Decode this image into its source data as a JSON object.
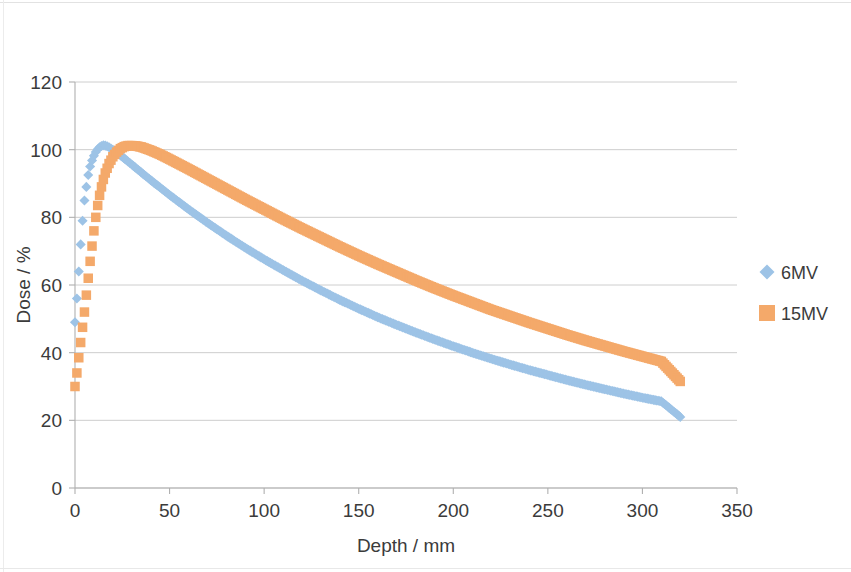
{
  "chart_data": {
    "type": "scatter",
    "title": "",
    "xlabel": "Depth / mm",
    "ylabel": "Dose / %",
    "xlim": [
      0,
      350
    ],
    "ylim": [
      0,
      120
    ],
    "xticks": [
      0,
      50,
      100,
      150,
      200,
      250,
      300,
      350
    ],
    "yticks": [
      0,
      20,
      40,
      60,
      80,
      100,
      120
    ],
    "grid": "horizontal",
    "legend_position": "right",
    "series": [
      {
        "name": "6MV",
        "marker": "diamond",
        "color": "#9DC3E6",
        "x": [
          0,
          1,
          2,
          3,
          4,
          5,
          6,
          7,
          8,
          9,
          10,
          11,
          12,
          13,
          14,
          15,
          16,
          17,
          18,
          20,
          22,
          25,
          28,
          30,
          35,
          40,
          45,
          50,
          60,
          70,
          80,
          90,
          100,
          110,
          120,
          130,
          140,
          150,
          160,
          170,
          180,
          190,
          200,
          210,
          220,
          230,
          240,
          250,
          260,
          270,
          280,
          290,
          300,
          310,
          320
        ],
        "y": [
          49,
          56,
          64,
          72,
          79,
          85,
          89,
          92.5,
          95,
          96.8,
          98.2,
          99.3,
          100.1,
          100.7,
          101.1,
          101.3,
          101.2,
          101.0,
          100.7,
          100.0,
          99.2,
          97.9,
          96.5,
          95.6,
          93.3,
          91.0,
          88.8,
          86.6,
          82.4,
          78.4,
          74.6,
          71.0,
          67.6,
          64.4,
          61.3,
          58.4,
          55.6,
          53.0,
          50.5,
          48.2,
          46.0,
          43.9,
          41.9,
          40.0,
          38.2,
          36.5,
          34.9,
          33.4,
          31.9,
          30.5,
          29.2,
          27.9,
          26.7,
          25.6,
          21.0
        ]
      },
      {
        "name": "15MV",
        "marker": "square",
        "color": "#F4A96A",
        "x": [
          0,
          1,
          2,
          3,
          4,
          5,
          6,
          7,
          8,
          9,
          10,
          11,
          12,
          13,
          14,
          15,
          16,
          18,
          20,
          22,
          24,
          26,
          28,
          30,
          32,
          35,
          40,
          45,
          50,
          60,
          70,
          80,
          90,
          100,
          110,
          120,
          130,
          140,
          150,
          160,
          170,
          180,
          190,
          200,
          210,
          220,
          230,
          240,
          250,
          260,
          270,
          280,
          290,
          300,
          310,
          320
        ],
        "y": [
          30,
          34,
          38.5,
          43,
          47.5,
          52,
          57,
          62,
          67,
          71.5,
          76,
          80,
          83.5,
          86.5,
          89,
          91.2,
          93.1,
          95.9,
          97.9,
          99.3,
          100.3,
          100.9,
          101.2,
          101.2,
          101.1,
          100.8,
          99.8,
          98.6,
          97.2,
          94.3,
          91.3,
          88.3,
          85.3,
          82.4,
          79.5,
          76.7,
          74.0,
          71.3,
          68.7,
          66.2,
          63.8,
          61.4,
          59.1,
          56.9,
          54.8,
          52.7,
          50.8,
          48.9,
          47.1,
          45.3,
          43.6,
          42.0,
          40.4,
          38.9,
          37.4,
          31.5
        ]
      }
    ]
  },
  "axes": {
    "y_title": "Dose / %",
    "x_title": "Depth / mm",
    "y_tick_labels": [
      "120",
      "100",
      "80",
      "60",
      "40",
      "20",
      "0"
    ],
    "x_tick_labels": [
      "0",
      "50",
      "100",
      "150",
      "200",
      "250",
      "300",
      "350"
    ]
  },
  "legend": {
    "entries": [
      {
        "label": "6MV",
        "color": "#9DC3E6",
        "marker": "diamond"
      },
      {
        "label": "15MV",
        "color": "#F4A96A",
        "marker": "square"
      }
    ]
  },
  "style": {
    "series_6mv_color": "#9DC3E6",
    "series_15mv_color": "#F4A96A",
    "gridline_color": "#C8C8C8",
    "axis_color": "#B0B0B0",
    "text_color": "#3B3B3B",
    "background": "#FFFFFF"
  }
}
